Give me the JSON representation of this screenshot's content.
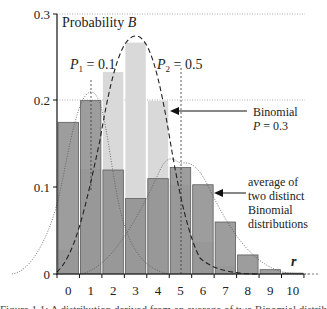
{
  "chart_data": {
    "type": "bar",
    "title": "Probability B",
    "xlabel": "r",
    "ylabel": "Probability B",
    "ylim": [
      0,
      0.3
    ],
    "yticks": [
      "0",
      "0.1",
      "0.2",
      "0.3"
    ],
    "categories": [
      "0",
      "1",
      "2",
      "3",
      "4",
      "5",
      "6",
      "7",
      "8",
      "9",
      "10"
    ],
    "series": [
      {
        "name": "Binomial P = 0.3",
        "style": "light grey bars",
        "color": "#d9d9d9",
        "values": [
          0.028,
          0.121,
          0.233,
          0.267,
          0.2,
          0.103,
          0.037,
          0.009,
          0.001,
          0.0,
          0.0
        ]
      },
      {
        "name": "average of two distinct Binomial distributions",
        "style": "dark grey bars",
        "color": "#8c8c8c",
        "values": [
          0.175,
          0.2,
          0.12,
          0.087,
          0.11,
          0.123,
          0.103,
          0.06,
          0.022,
          0.005,
          0.001
        ]
      }
    ],
    "curves": [
      {
        "name": "P1 = 0.1",
        "style": "dotted",
        "peak_r": 1
      },
      {
        "name": "Binomial P = 0.3 envelope",
        "style": "dashed",
        "peak_r": 3
      },
      {
        "name": "P2 = 0.5",
        "style": "dotted",
        "peak_r": 5
      }
    ],
    "annotations": [
      {
        "text_base": "P",
        "sub": "1",
        "text_rest": " = 0.1",
        "at_r": 1
      },
      {
        "text_base": "P",
        "sub": "2",
        "text_rest": " = 0.5",
        "at_r": 5
      },
      {
        "lines": [
          "Binomial",
          "P = 0.3"
        ],
        "arrow_to": "binomial bars"
      },
      {
        "lines": [
          "average of",
          "two distinct",
          "Binomial",
          "distributions"
        ],
        "arrow_to": "average bars"
      }
    ],
    "grid": "dotted lines at y = 0.2 and 0.3",
    "legend": "none (arrow annotations on right)"
  },
  "labels": {
    "ylabel_text": "Probability ",
    "ylabel_var": "B",
    "p1_var": "P",
    "p1_sub": "1",
    "p1_rest": " = 0.1",
    "p2_var": "P",
    "p2_sub": "2",
    "p2_rest": " = 0.5",
    "binomial_line1": "Binomial",
    "binomial_line2_var": "P",
    "binomial_line2_rest": " = 0.3",
    "avg_line1": "average of",
    "avg_line2": "two distinct",
    "avg_line3": "Binomial",
    "avg_line4": "distributions",
    "x_var": "r",
    "ytick_0": "0",
    "ytick_1": "0.1",
    "ytick_2": "0.2",
    "ytick_3": "0.3"
  },
  "caption": "Figure 1.1: A distribution derived from an average of two Binomial distributions..."
}
